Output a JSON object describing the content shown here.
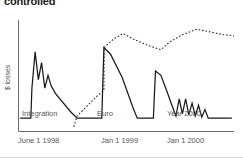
{
  "title": "controlled",
  "axes": {
    "ylabel": "$ losses",
    "xlabel": "",
    "x_ticks": [
      {
        "label": "June 1 1998",
        "x_px": 18
      },
      {
        "label": "Jan 1 1999",
        "x_px": 101
      },
      {
        "label": "Jan 1 2000",
        "x_px": 167
      }
    ],
    "y_ticks": []
  },
  "annotations": [
    {
      "label": "Integration",
      "x_px": 22,
      "y_px": 113
    },
    {
      "label": "Euro",
      "x_px": 97,
      "y_px": 113
    },
    {
      "label": "Year 2000",
      "x_px": 167,
      "y_px": 113
    }
  ],
  "colors": {
    "axis": "#6b6b6b",
    "solid_series": "#1a1a1a",
    "dashed_series": "#2b2b2b",
    "label_text": "#555555",
    "title_text": "#1a1a1a",
    "background": "#ffffff"
  },
  "chart_data": {
    "type": "line",
    "title": "controlled",
    "xlabel": "",
    "ylabel": "$ losses",
    "grid": false,
    "legend": "none",
    "xlim": [
      0,
      100
    ],
    "ylim": [
      0,
      100
    ],
    "x_tick_labels": [
      "June 1 1998",
      "Jan 1 1999",
      "Jan 1 2000"
    ],
    "x_tick_positions": [
      2,
      40,
      72
    ],
    "annotations": [
      "Integration",
      "Euro",
      "Year 2000"
    ],
    "series": [
      {
        "name": "actual losses",
        "style": "solid",
        "color": "#1a1a1a",
        "points": [
          [
            0.5,
            12
          ],
          [
            5.5,
            12
          ],
          [
            6.0,
            40
          ],
          [
            7.5,
            74
          ],
          [
            9.0,
            48
          ],
          [
            10.5,
            64
          ],
          [
            12.0,
            40
          ],
          [
            13.5,
            52
          ],
          [
            15.0,
            42
          ],
          [
            17.0,
            35
          ],
          [
            24.0,
            18
          ],
          [
            27.0,
            12
          ],
          [
            38.5,
            12
          ],
          [
            39.0,
            45
          ],
          [
            39.5,
            78
          ],
          [
            42.5,
            72
          ],
          [
            48.0,
            50
          ],
          [
            53.0,
            22
          ],
          [
            55.0,
            12
          ],
          [
            62.5,
            12
          ],
          [
            63.0,
            35
          ],
          [
            63.5,
            56
          ],
          [
            66.0,
            52
          ],
          [
            69.0,
            36
          ],
          [
            71.5,
            22
          ],
          [
            73.0,
            14
          ],
          [
            74.5,
            30
          ],
          [
            76.0,
            16
          ],
          [
            77.5,
            30
          ],
          [
            79.0,
            15
          ],
          [
            80.5,
            26
          ],
          [
            82.0,
            14
          ],
          [
            83.5,
            24
          ],
          [
            85.0,
            13
          ],
          [
            86.5,
            20
          ],
          [
            88.0,
            12
          ],
          [
            99.0,
            12
          ]
        ]
      },
      {
        "name": "projected losses without response",
        "style": "dashed",
        "color": "#2b2b2b",
        "points": [
          [
            25.5,
            4
          ],
          [
            27.0,
            14
          ],
          [
            31.0,
            22
          ],
          [
            36.0,
            32
          ],
          [
            39.5,
            38
          ],
          [
            39.6,
            78
          ],
          [
            44.0,
            86
          ],
          [
            48.5,
            91
          ],
          [
            53.0,
            86
          ],
          [
            60.0,
            80
          ],
          [
            66.0,
            76
          ],
          [
            70.0,
            83
          ],
          [
            76.0,
            90
          ],
          [
            82.5,
            95
          ],
          [
            88.0,
            93
          ],
          [
            95.0,
            90
          ],
          [
            100.0,
            89
          ]
        ]
      }
    ]
  }
}
